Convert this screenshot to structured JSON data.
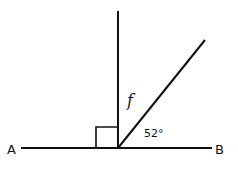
{
  "diagram": {
    "type": "geometry-angles",
    "points": {
      "A": {
        "label": "A"
      },
      "B": {
        "label": "B"
      }
    },
    "angles": {
      "unknown": {
        "label": "f"
      },
      "given": {
        "label": "52°",
        "value_degrees": 52
      },
      "right_angle": {
        "marker": "square",
        "value_degrees": 90
      }
    },
    "colors": {
      "stroke": "#111111",
      "background": "#ffffff"
    }
  }
}
